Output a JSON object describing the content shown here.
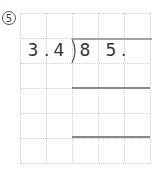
{
  "problem": {
    "number_label": "5",
    "divisor": [
      "3",
      ".",
      "4"
    ],
    "dividend": [
      "8",
      "5",
      "."
    ],
    "grid": {
      "columns": 5,
      "rows": 6
    },
    "colors": {
      "text": "#333333",
      "grid": "#cfcfcf",
      "rule": "#888888"
    }
  }
}
